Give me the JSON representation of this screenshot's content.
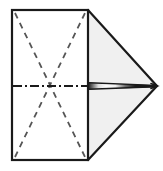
{
  "figure": {
    "type": "line-drawing",
    "canvas": {
      "width": 163,
      "height": 171,
      "background": "#ffffff"
    },
    "colors": {
      "outline": "#1a1a1a",
      "shaded_fill": "#f0f0f0",
      "body_fill": "#ffffff",
      "fold_line": "#555555",
      "center_line": "#1a1a1a",
      "sliver_dark": "#1a1a1a",
      "sliver_light": "#ffffff"
    },
    "geometry": {
      "rect": {
        "left": 12,
        "top": 10,
        "right": 88,
        "bottom": 160
      },
      "apex": {
        "x": 157,
        "y": 86
      },
      "center": {
        "x": 88,
        "y": 86
      },
      "sliver_start_x": 88,
      "sliver_end_x": 155,
      "stroke_width": 2
    },
    "shapes": [
      {
        "name": "base-rectangle",
        "kind": "rect",
        "fill": "#ffffff",
        "points": "12,10 88,10 88,160 12,160"
      },
      {
        "name": "upper-shaded-triangle",
        "kind": "polygon",
        "fill": "#f0f0f0",
        "points": "88,10 157,86 88,86"
      },
      {
        "name": "lower-shaded-triangle",
        "kind": "polygon",
        "fill": "#f0f0f0",
        "points": "88,160 157,86 88,86"
      }
    ],
    "lines": [
      {
        "name": "fold-diagonal-top-left-to-bottom-right",
        "style": "dashed",
        "from": {
          "x": 15,
          "y": 13
        },
        "to": {
          "x": 85,
          "y": 157
        }
      },
      {
        "name": "fold-diagonal-bottom-left-to-top-right",
        "style": "dashed",
        "from": {
          "x": 15,
          "y": 157
        },
        "to": {
          "x": 85,
          "y": 13
        }
      },
      {
        "name": "horizontal-center-line",
        "style": "dash-dot",
        "from": {
          "x": 13,
          "y": 86
        },
        "to": {
          "x": 90,
          "y": 86
        }
      }
    ],
    "labels": []
  }
}
